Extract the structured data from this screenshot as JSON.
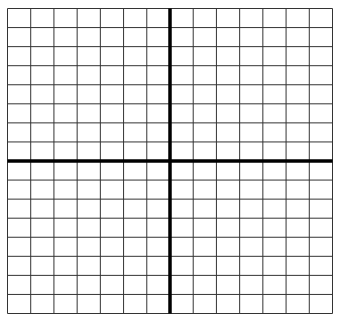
{
  "diagram": {
    "type": "coordinate-grid",
    "columns": 14,
    "rows": 16,
    "grid_left": 7.5,
    "grid_top": 8.5,
    "grid_right": 332.5,
    "grid_bottom": 313.5,
    "axis_x_col": 7,
    "axis_y_row": 8,
    "grid_color": "#333333",
    "axis_color": "#000000",
    "grid_line_width": 1,
    "axis_line_width": 3.5,
    "background": "#ffffff"
  }
}
